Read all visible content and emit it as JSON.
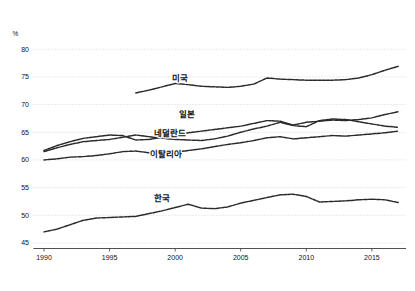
{
  "chart_data": {
    "type": "line",
    "title": "",
    "subtitle": "",
    "xlabel": "",
    "ylabel": "",
    "unit_label": "%",
    "xlim": [
      1989.2,
      2017.6
    ],
    "ylim": [
      44.0,
      81.3
    ],
    "grid": true,
    "legend_position": "inline-labels",
    "yticks": [
      45,
      50,
      55,
      60,
      65,
      70,
      75,
      80
    ],
    "ytick_labels": [
      "45",
      "50",
      "55",
      "60",
      "65",
      "70",
      "75",
      "80"
    ],
    "xticks": [
      1990,
      1995,
      2000,
      2005,
      2010,
      2015
    ],
    "xtick_labels": [
      "1990",
      "1995",
      "2000",
      "2005",
      "2010",
      "2015"
    ],
    "series": [
      {
        "name": "미국",
        "label": "미국",
        "label_x": 2000.4,
        "label_y": 74.6,
        "x": [
          1997,
          1998,
          1999,
          2000,
          2001,
          2002,
          2003,
          2004,
          2005,
          2006,
          2007,
          2008,
          2009,
          2010,
          2011,
          2012,
          2013,
          2014,
          2015,
          2016,
          2017
        ],
        "values": [
          72.1,
          72.6,
          73.2,
          73.8,
          73.6,
          73.3,
          73.2,
          73.1,
          73.3,
          73.7,
          74.8,
          74.6,
          74.5,
          74.4,
          74.4,
          74.4,
          74.5,
          74.8,
          75.4,
          76.2,
          76.9
        ]
      },
      {
        "name": "일본",
        "label": "일본",
        "label_x": 2000.9,
        "label_y": 68.2,
        "x": [
          1990,
          1991,
          1992,
          1993,
          1994,
          1995,
          1996,
          1997,
          1998,
          1999,
          2000,
          2001,
          2002,
          2003,
          2004,
          2005,
          2006,
          2007,
          2008,
          2009,
          2010,
          2011,
          2012,
          2013,
          2014,
          2015,
          2016,
          2017
        ],
        "values": [
          61.5,
          62.2,
          62.8,
          63.3,
          63.5,
          63.7,
          64.1,
          64.5,
          64.2,
          63.9,
          63.7,
          63.6,
          63.5,
          63.8,
          64.3,
          65.0,
          65.6,
          66.1,
          66.8,
          66.2,
          66.0,
          67.1,
          67.4,
          67.3,
          66.9,
          66.5,
          66.1,
          65.9
        ]
      },
      {
        "name": "네덜란드",
        "label": "네덜란드",
        "label_x": 1999.6,
        "label_y": 64.7,
        "x": [
          1990,
          1991,
          1992,
          1993,
          1994,
          1995,
          1996,
          1997,
          1998,
          1999,
          2000,
          2001,
          2002,
          2003,
          2004,
          2005,
          2006,
          2007,
          2008,
          2009,
          2010,
          2011,
          2012,
          2013,
          2014,
          2015,
          2016,
          2017
        ],
        "values": [
          61.7,
          62.6,
          63.3,
          63.9,
          64.2,
          64.5,
          64.4,
          63.6,
          63.7,
          64.1,
          64.5,
          64.9,
          65.2,
          65.5,
          65.8,
          66.1,
          66.6,
          67.1,
          67.0,
          66.3,
          66.8,
          67.0,
          67.2,
          67.1,
          67.3,
          67.6,
          68.2,
          68.7
        ]
      },
      {
        "name": "이탈리아",
        "label": "이탈리아",
        "label_x": 1999.3,
        "label_y": 61.0,
        "x": [
          1990,
          1991,
          1992,
          1993,
          1994,
          1995,
          1996,
          1997,
          1998,
          1999,
          2000,
          2001,
          2002,
          2003,
          2004,
          2005,
          2006,
          2007,
          2008,
          2009,
          2010,
          2011,
          2012,
          2013,
          2014,
          2015,
          2016,
          2017
        ],
        "values": [
          60.0,
          60.2,
          60.5,
          60.6,
          60.8,
          61.1,
          61.5,
          61.6,
          61.3,
          61.2,
          61.4,
          61.7,
          62.0,
          62.4,
          62.8,
          63.1,
          63.5,
          64.0,
          64.2,
          63.8,
          64.0,
          64.2,
          64.4,
          64.3,
          64.5,
          64.7,
          64.9,
          65.2
        ]
      },
      {
        "name": "한국",
        "label": "한국",
        "label_x": 1999.0,
        "label_y": 52.9,
        "x": [
          1990,
          1991,
          1992,
          1993,
          1994,
          1995,
          1996,
          1997,
          1998,
          1999,
          2000,
          2001,
          2002,
          2003,
          2004,
          2005,
          2006,
          2007,
          2008,
          2009,
          2010,
          2011,
          2012,
          2013,
          2014,
          2015,
          2016,
          2017
        ],
        "values": [
          47.0,
          47.5,
          48.3,
          49.1,
          49.5,
          49.6,
          49.7,
          49.8,
          50.3,
          50.8,
          51.4,
          52.0,
          51.3,
          51.2,
          51.5,
          52.2,
          52.7,
          53.2,
          53.7,
          53.8,
          53.4,
          52.4,
          52.5,
          52.6,
          52.8,
          52.9,
          52.8,
          52.3
        ]
      }
    ]
  }
}
